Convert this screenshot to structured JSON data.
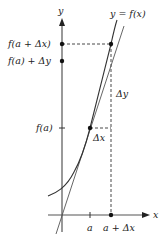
{
  "diagram": {
    "axes": {
      "x_label": "x",
      "y_label": "y"
    },
    "curve_label": "y = f(x)",
    "y_ticks": {
      "f_a": "f(a)",
      "f_a_plus_dx": "f(a + Δx)",
      "f_a_plus_dy": "f(a) + Δy"
    },
    "x_ticks": {
      "a": "a",
      "a_plus_dx": "a + Δx"
    },
    "annotations": {
      "delta_x": "Δx",
      "delta_y": "Δy"
    },
    "colors": {
      "axis": "#444444",
      "curve": "#333333",
      "tangent": "#555555",
      "dashed": "#333333"
    }
  }
}
